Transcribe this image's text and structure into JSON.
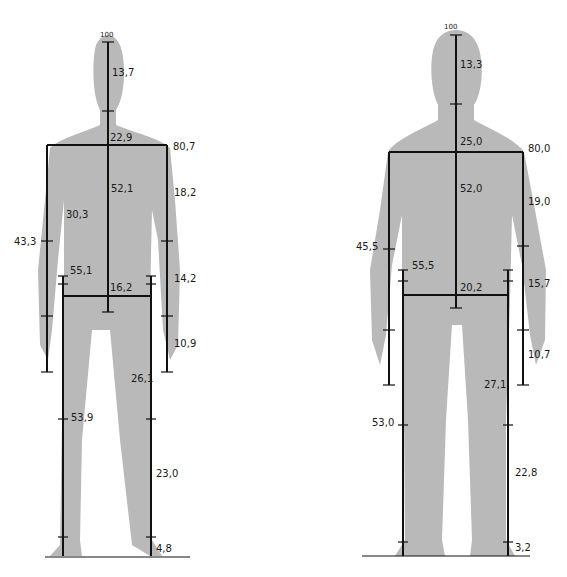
{
  "figures": [
    {
      "id": "left",
      "top_label": "100",
      "head": "13,7",
      "shoulder_width": "22,9",
      "shoulder_height": "80,7",
      "torso": "52,1",
      "upper_arm": "18,2",
      "arm_side": "30,3",
      "reach": "43,3",
      "hip_height": "55,1",
      "hip_width": "16,2",
      "forearm": "14,2",
      "hand": "10,9",
      "thigh": "26,1",
      "leg_total": "53,9",
      "shin": "23,0",
      "foot": "4,8"
    },
    {
      "id": "right",
      "top_label": "100",
      "head": "13,3",
      "shoulder_width": "25,0",
      "shoulder_height": "80,0",
      "torso": "52,0",
      "upper_arm": "19,0",
      "reach": "45,5",
      "hip_height": "55,5",
      "hip_width": "20,2",
      "forearm": "15,7",
      "hand": "10,7",
      "thigh": "27,1",
      "leg_total": "53,0",
      "shin": "22,8",
      "foot": "3,2"
    }
  ]
}
